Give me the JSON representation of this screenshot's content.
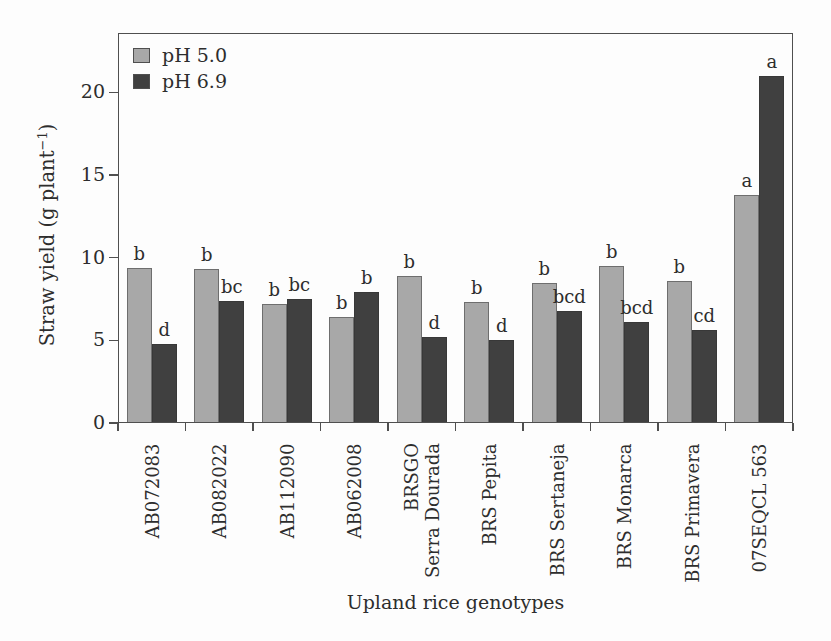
{
  "colors": {
    "ph50_fill": "#a8a8a8",
    "ph50_border": "#6e6e6e",
    "ph69_fill": "#404040",
    "ph69_border": "#383838",
    "frame": "#4f4f4f",
    "text": "#2d2d2d",
    "background": "#fdfdfd"
  },
  "chart_data": {
    "type": "bar",
    "xlabel": "Upland rice genotypes",
    "ylabel": "Straw yield (g plant⁻¹)",
    "ylabel_parts": {
      "prefix": "Straw yield (g plant",
      "superscript": "−1",
      "suffix": ")"
    },
    "ylim": [
      0,
      23.6
    ],
    "yticks": [
      0,
      5,
      10,
      15,
      20
    ],
    "grid": false,
    "legend_position": "upper-left-inside",
    "categories": [
      "AB072083",
      "AB082022",
      "AB112090",
      "AB062008",
      "BRSGO\nSerra Dourada",
      "BRS Pepita",
      "BRS Sertaneja",
      "BRS Monarca",
      "BRS Primavera",
      "07SEQCL 563"
    ],
    "series": [
      {
        "name": "pH 5.0",
        "color_key": "ph50",
        "values": [
          9.4,
          9.3,
          7.2,
          6.4,
          8.9,
          7.3,
          8.5,
          9.5,
          8.6,
          13.8
        ],
        "letters": [
          "b",
          "b",
          "b",
          "b",
          "b",
          "b",
          "b",
          "b",
          "b",
          "a"
        ]
      },
      {
        "name": "pH 6.9",
        "color_key": "ph69",
        "values": [
          4.8,
          7.4,
          7.5,
          7.9,
          5.2,
          5.0,
          6.8,
          6.1,
          5.6,
          21.0
        ],
        "letters": [
          "d",
          "bc",
          "bc",
          "b",
          "d",
          "d",
          "bcd",
          "bcd",
          "cd",
          "a"
        ]
      }
    ]
  }
}
